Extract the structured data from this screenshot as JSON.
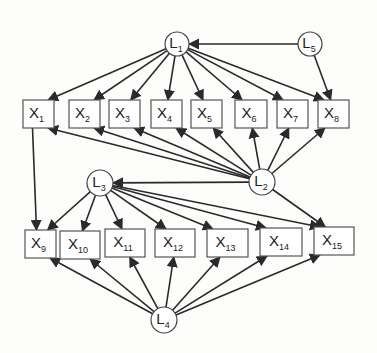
{
  "diagram": {
    "type": "path-model",
    "colors": {
      "stroke": "#2a2a2a",
      "node_border": "#555555",
      "background": "#fdfdfb"
    },
    "latent_nodes": [
      {
        "id": "L1",
        "base": "L",
        "sub": "1",
        "cx": 177,
        "cy": 44,
        "r": 12
      },
      {
        "id": "L5",
        "base": "L",
        "sub": "5",
        "cx": 310,
        "cy": 44,
        "r": 12
      },
      {
        "id": "L2",
        "base": "L",
        "sub": "2",
        "cx": 262,
        "cy": 182,
        "r": 13
      },
      {
        "id": "L3",
        "base": "L",
        "sub": "3",
        "cx": 100,
        "cy": 183,
        "r": 13
      },
      {
        "id": "L4",
        "base": "L",
        "sub": "4",
        "cx": 164,
        "cy": 320,
        "r": 13
      }
    ],
    "observed_nodes": [
      {
        "id": "X1",
        "base": "X",
        "sub": "1",
        "x": 23,
        "y": 100,
        "w": 31,
        "h": 28
      },
      {
        "id": "X2",
        "base": "X",
        "sub": "2",
        "x": 69,
        "y": 100,
        "w": 31,
        "h": 28
      },
      {
        "id": "X3",
        "base": "X",
        "sub": "3",
        "x": 109,
        "y": 100,
        "w": 31,
        "h": 28
      },
      {
        "id": "X4",
        "base": "X",
        "sub": "4",
        "x": 151,
        "y": 100,
        "w": 31,
        "h": 28
      },
      {
        "id": "X5",
        "base": "X",
        "sub": "5",
        "x": 191,
        "y": 100,
        "w": 31,
        "h": 28
      },
      {
        "id": "X6",
        "base": "X",
        "sub": "6",
        "x": 235,
        "y": 100,
        "w": 32,
        "h": 28
      },
      {
        "id": "X7",
        "base": "X",
        "sub": "7",
        "x": 277,
        "y": 100,
        "w": 31,
        "h": 28
      },
      {
        "id": "X8",
        "base": "X",
        "sub": "8",
        "x": 318,
        "y": 100,
        "w": 31,
        "h": 28
      },
      {
        "id": "X9",
        "base": "X",
        "sub": "9",
        "x": 25,
        "y": 230,
        "w": 31,
        "h": 28
      },
      {
        "id": "X10",
        "base": "X",
        "sub": "10",
        "x": 60,
        "y": 231,
        "w": 40,
        "h": 28
      },
      {
        "id": "X11",
        "base": "X",
        "sub": "11",
        "x": 105,
        "y": 229,
        "w": 40,
        "h": 28
      },
      {
        "id": "X12",
        "base": "X",
        "sub": "12",
        "x": 155,
        "y": 229,
        "w": 40,
        "h": 28
      },
      {
        "id": "X13",
        "base": "X",
        "sub": "13",
        "x": 207,
        "y": 229,
        "w": 41,
        "h": 28
      },
      {
        "id": "X14",
        "base": "X",
        "sub": "14",
        "x": 260,
        "y": 228,
        "w": 42,
        "h": 28
      },
      {
        "id": "X15",
        "base": "X",
        "sub": "15",
        "x": 314,
        "y": 227,
        "w": 40,
        "h": 28
      }
    ],
    "edges": [
      {
        "from": "L5",
        "to": "L1"
      },
      {
        "from": "L5",
        "to": "X8"
      },
      {
        "from": "L1",
        "to": "X1"
      },
      {
        "from": "L1",
        "to": "X2"
      },
      {
        "from": "L1",
        "to": "X3"
      },
      {
        "from": "L1",
        "to": "X4"
      },
      {
        "from": "L1",
        "to": "X5"
      },
      {
        "from": "L1",
        "to": "X6"
      },
      {
        "from": "L1",
        "to": "X7"
      },
      {
        "from": "L1",
        "to": "X8"
      },
      {
        "from": "L2",
        "to": "X1"
      },
      {
        "from": "L2",
        "to": "X2"
      },
      {
        "from": "L2",
        "to": "X3"
      },
      {
        "from": "L2",
        "to": "X4"
      },
      {
        "from": "L2",
        "to": "X5"
      },
      {
        "from": "L2",
        "to": "X6"
      },
      {
        "from": "L2",
        "to": "X7"
      },
      {
        "from": "L2",
        "to": "X8"
      },
      {
        "from": "L2",
        "to": "L3"
      },
      {
        "from": "L2",
        "to": "X15"
      },
      {
        "from": "X1",
        "to": "X9"
      },
      {
        "from": "L3",
        "to": "X9"
      },
      {
        "from": "L3",
        "to": "X10"
      },
      {
        "from": "L3",
        "to": "X11"
      },
      {
        "from": "L3",
        "to": "X12"
      },
      {
        "from": "L3",
        "to": "X13"
      },
      {
        "from": "L3",
        "to": "X14"
      },
      {
        "from": "L3",
        "to": "X15"
      },
      {
        "from": "L4",
        "to": "X9"
      },
      {
        "from": "L4",
        "to": "X10"
      },
      {
        "from": "L4",
        "to": "X11"
      },
      {
        "from": "L4",
        "to": "X12"
      },
      {
        "from": "L4",
        "to": "X13"
      },
      {
        "from": "L4",
        "to": "X14"
      },
      {
        "from": "L4",
        "to": "X15"
      }
    ]
  }
}
